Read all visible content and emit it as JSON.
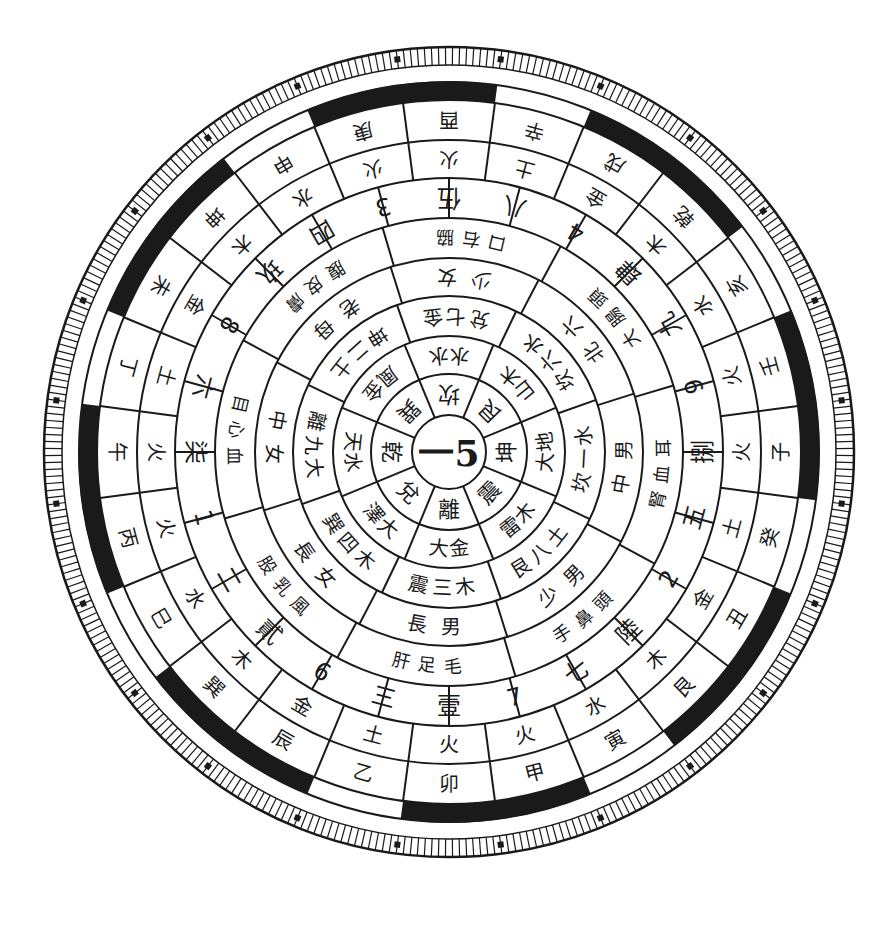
{
  "diagram": {
    "center": {
      "text": "一5"
    },
    "ring_trigrams": [
      "坎",
      "艮",
      "坤",
      "震",
      "離",
      "兌",
      "乾",
      "巽"
    ],
    "ring_2": [
      "水水",
      "山木",
      "大地",
      "雷木",
      "大金",
      "澤大",
      "天水",
      "風金"
    ],
    "ring_3": [
      "兌七金",
      "坎六水",
      "坎一水",
      "艮八土",
      "震三木",
      "巽四木",
      "離九大",
      "坤二土"
    ],
    "ring_4": [
      "少女",
      "北六",
      "中男",
      "少男",
      "長男",
      "長女",
      "中女",
      "老母"
    ],
    "ring_5": [
      "口右脇",
      "大腸頭",
      "腎血耳",
      "手鼻頭",
      "肝足毛",
      "股乳風",
      "目心血",
      "腹皮膚"
    ],
    "ring_numbers": [
      "伍",
      "八",
      "4",
      "肆",
      "九",
      "9",
      "捌",
      "五",
      "2",
      "陸",
      "七",
      "7",
      "壹",
      "三",
      "6",
      "貳",
      "二",
      "1",
      "柒",
      "六",
      "8",
      "玖",
      "四",
      "3"
    ],
    "ring_elements": [
      "火",
      "土",
      "金",
      "木",
      "水",
      "火",
      "火",
      "土",
      "金",
      "木",
      "水",
      "火",
      "火",
      "土",
      "金",
      "木",
      "水",
      "火",
      "火",
      "土",
      "金",
      "木",
      "水",
      "火"
    ],
    "ring_branches": [
      "酉",
      "辛",
      "戌",
      "乾",
      "亥",
      "壬",
      "子",
      "癸",
      "丑",
      "艮",
      "寅",
      "甲",
      "卯",
      "乙",
      "辰",
      "巽",
      "巳",
      "丙",
      "午",
      "丁",
      "未",
      "坤",
      "申",
      "庚"
    ],
    "colors": {
      "ink": "#1a1a1a",
      "paper": "#ffffff"
    }
  }
}
